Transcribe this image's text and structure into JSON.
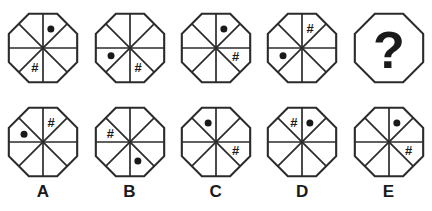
{
  "puzzle": {
    "type": "matrix-reasoning",
    "shape": "octagon",
    "sector_count": 8,
    "colors": {
      "shaded_fill": "#8b8b8b",
      "outline": "#2b2b2b",
      "background": "#ffffff",
      "glyph": "#1a1a1a"
    },
    "glyph_names": {
      "dot": "dot-glyph",
      "hash": "hash-glyph",
      "question": "question-mark-glyph"
    },
    "glyph_text": {
      "hash": "#",
      "question": "?"
    }
  },
  "problem_row": {
    "name": "problem-sequence",
    "figures": [
      {
        "id": "problem-1",
        "shaded_sectors": [
          7
        ],
        "markers": [
          {
            "type": "dot",
            "sector": 0
          },
          {
            "type": "hash",
            "sector": 4
          }
        ],
        "divided": true,
        "is_missing": false
      },
      {
        "id": "problem-2",
        "shaded_sectors": [
          6
        ],
        "markers": [
          {
            "type": "dot",
            "sector": 5
          },
          {
            "type": "hash",
            "sector": 3
          }
        ],
        "divided": true,
        "is_missing": false
      },
      {
        "id": "problem-3",
        "shaded_sectors": [
          5
        ],
        "markers": [
          {
            "type": "dot",
            "sector": 0
          },
          {
            "type": "hash",
            "sector": 2
          }
        ],
        "divided": true,
        "is_missing": false
      },
      {
        "id": "problem-4",
        "shaded_sectors": [
          3
        ],
        "markers": [
          {
            "type": "hash",
            "sector": 0
          },
          {
            "type": "dot",
            "sector": 5
          }
        ],
        "divided": true,
        "is_missing": false
      },
      {
        "id": "problem-5-missing",
        "shaded_sectors": [],
        "markers": [],
        "divided": false,
        "is_missing": true,
        "missing_label": "?"
      }
    ]
  },
  "options_row": {
    "name": "answer-options",
    "figures": [
      {
        "id": "option-A",
        "label": "A",
        "shaded_sectors": [
          4
        ],
        "markers": [
          {
            "type": "hash",
            "sector": 0
          },
          {
            "type": "dot",
            "sector": 6
          }
        ],
        "divided": true
      },
      {
        "id": "option-B",
        "label": "B",
        "shaded_sectors": [
          2
        ],
        "markers": [
          {
            "type": "hash",
            "sector": 6
          },
          {
            "type": "dot",
            "sector": 3
          }
        ],
        "divided": true
      },
      {
        "id": "option-C",
        "label": "C",
        "shaded_sectors": [
          3
        ],
        "markers": [
          {
            "type": "dot",
            "sector": 7
          },
          {
            "type": "hash",
            "sector": 2
          }
        ],
        "divided": true
      },
      {
        "id": "option-D",
        "label": "D",
        "shaded_sectors": [
          3
        ],
        "markers": [
          {
            "type": "hash",
            "sector": 7
          },
          {
            "type": "dot",
            "sector": 0
          }
        ],
        "divided": true
      },
      {
        "id": "option-E",
        "label": "E",
        "shaded_sectors": [
          4
        ],
        "markers": [
          {
            "type": "dot",
            "sector": 0
          },
          {
            "type": "hash",
            "sector": 2
          }
        ],
        "divided": true
      }
    ],
    "labels": [
      "A",
      "B",
      "C",
      "D",
      "E"
    ]
  }
}
